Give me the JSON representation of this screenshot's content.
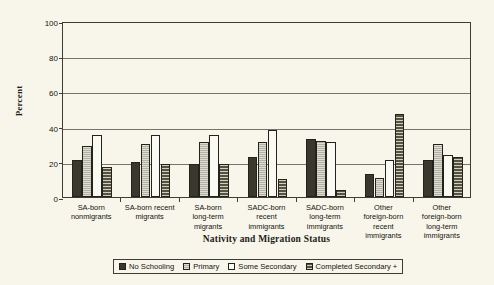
{
  "chart_data": {
    "type": "bar",
    "title": "",
    "xlabel": "Nativity and Migration Status",
    "ylabel": "Percent",
    "ylim": [
      0,
      100
    ],
    "yticks": [
      0,
      20,
      40,
      60,
      80,
      100
    ],
    "grid": true,
    "legend_position": "bottom",
    "categories": [
      "SA-born nonmigrants",
      "SA-born recent migrants",
      "SA-born long-term migrants",
      "SADC-born recent immigrants",
      "SADC-born long-term immigrants",
      "Other foreign-born recent immigrants",
      "Other foreign-born long-term immigrants"
    ],
    "category_lines": [
      [
        "SA-born",
        "nonmigrants"
      ],
      [
        "SA-born recent",
        "migrants"
      ],
      [
        "SA-born",
        "long-term",
        "migrants"
      ],
      [
        "SADC-born",
        "recent",
        "immigrants"
      ],
      [
        "SADC-born",
        "long-term",
        "immigrants"
      ],
      [
        "Other",
        "foreign-born",
        "recent",
        "immigrants"
      ],
      [
        "Other",
        "foreign-born",
        "long-term",
        "immigrants"
      ]
    ],
    "series": [
      {
        "name": "No Schooling",
        "values": [
          21,
          20,
          19,
          23,
          33,
          13,
          21
        ]
      },
      {
        "name": "Primary",
        "values": [
          29,
          30,
          31,
          31,
          32,
          11,
          30
        ]
      },
      {
        "name": "Some Secondary",
        "values": [
          35,
          35,
          35,
          38,
          31,
          21,
          24
        ]
      },
      {
        "name": "Completed Secondary +",
        "values": [
          17,
          19,
          19,
          10,
          4,
          47,
          23
        ]
      }
    ]
  },
  "legend": {
    "items": [
      {
        "label": "No Schooling"
      },
      {
        "label": "Primary"
      },
      {
        "label": "Some Secondary"
      },
      {
        "label": "Completed Secondary +"
      }
    ]
  }
}
